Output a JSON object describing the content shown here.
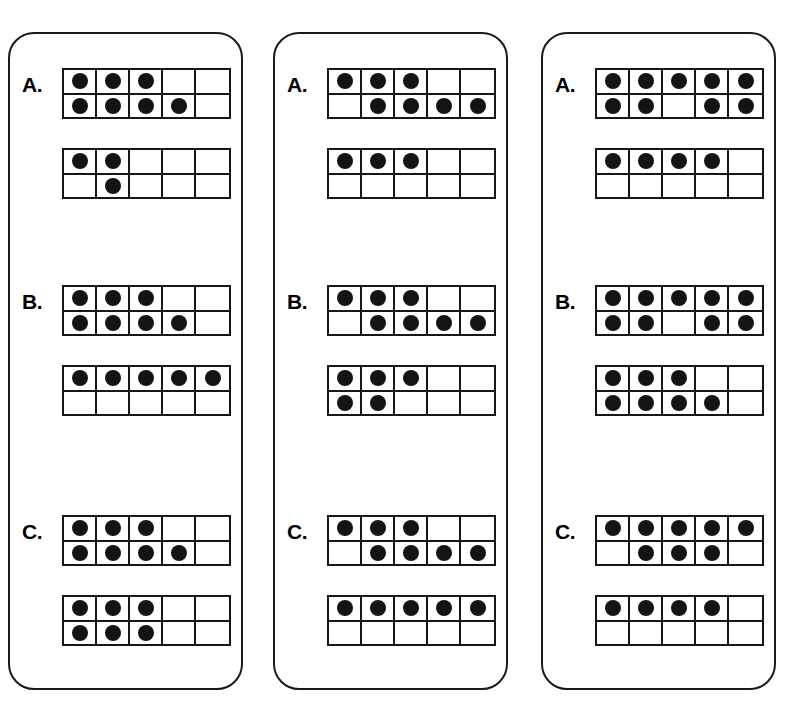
{
  "page": {
    "background_color": "#ffffff",
    "ink_color": "#141414",
    "card_border_color": "#1a1a1a",
    "grid_line_color": "#171717",
    "dot_color": "#141414"
  },
  "cards": [
    {
      "name": "card-1",
      "items": [
        {
          "label": "A.",
          "frames": [
            {
              "name": "ten-frame-top",
              "top_row": [
                true,
                true,
                true,
                false,
                false
              ],
              "bottom_row": [
                true,
                true,
                true,
                true,
                false
              ],
              "count": 7
            },
            {
              "name": "ten-frame-bottom",
              "top_row": [
                true,
                true,
                false,
                false,
                false
              ],
              "bottom_row": [
                false,
                true,
                false,
                false,
                false
              ],
              "count": 3
            }
          ]
        },
        {
          "label": "B.",
          "frames": [
            {
              "name": "ten-frame-top",
              "top_row": [
                true,
                true,
                true,
                false,
                false
              ],
              "bottom_row": [
                true,
                true,
                true,
                true,
                false
              ],
              "count": 7
            },
            {
              "name": "ten-frame-bottom",
              "top_row": [
                true,
                true,
                true,
                true,
                true
              ],
              "bottom_row": [
                false,
                false,
                false,
                false,
                false
              ],
              "count": 5
            }
          ]
        },
        {
          "label": "C.",
          "frames": [
            {
              "name": "ten-frame-top",
              "top_row": [
                true,
                true,
                true,
                false,
                false
              ],
              "bottom_row": [
                true,
                true,
                true,
                true,
                false
              ],
              "count": 7
            },
            {
              "name": "ten-frame-bottom",
              "top_row": [
                true,
                true,
                true,
                false,
                false
              ],
              "bottom_row": [
                true,
                true,
                true,
                false,
                false
              ],
              "count": 6
            }
          ]
        }
      ]
    },
    {
      "name": "card-2",
      "items": [
        {
          "label": "A.",
          "frames": [
            {
              "name": "ten-frame-top",
              "top_row": [
                true,
                true,
                true,
                false,
                false
              ],
              "bottom_row": [
                false,
                true,
                true,
                true,
                true
              ],
              "count": 7
            },
            {
              "name": "ten-frame-bottom",
              "top_row": [
                true,
                true,
                true,
                false,
                false
              ],
              "bottom_row": [
                false,
                false,
                false,
                false,
                false
              ],
              "count": 3
            }
          ]
        },
        {
          "label": "B.",
          "frames": [
            {
              "name": "ten-frame-top",
              "top_row": [
                true,
                true,
                true,
                false,
                false
              ],
              "bottom_row": [
                false,
                true,
                true,
                true,
                true
              ],
              "count": 7
            },
            {
              "name": "ten-frame-bottom",
              "top_row": [
                true,
                true,
                true,
                false,
                false
              ],
              "bottom_row": [
                true,
                true,
                false,
                false,
                false
              ],
              "count": 5
            }
          ]
        },
        {
          "label": "C.",
          "frames": [
            {
              "name": "ten-frame-top",
              "top_row": [
                true,
                true,
                true,
                false,
                false
              ],
              "bottom_row": [
                false,
                true,
                true,
                true,
                true
              ],
              "count": 7
            },
            {
              "name": "ten-frame-bottom",
              "top_row": [
                true,
                true,
                true,
                true,
                true
              ],
              "bottom_row": [
                false,
                false,
                false,
                false,
                false
              ],
              "count": 5
            }
          ]
        }
      ]
    },
    {
      "name": "card-3",
      "items": [
        {
          "label": "A.",
          "frames": [
            {
              "name": "ten-frame-top",
              "top_row": [
                true,
                true,
                true,
                true,
                true
              ],
              "bottom_row": [
                true,
                true,
                false,
                true,
                true
              ],
              "count": 9
            },
            {
              "name": "ten-frame-bottom",
              "top_row": [
                true,
                true,
                true,
                true,
                false
              ],
              "bottom_row": [
                false,
                false,
                false,
                false,
                false
              ],
              "count": 4
            }
          ]
        },
        {
          "label": "B.",
          "frames": [
            {
              "name": "ten-frame-top",
              "top_row": [
                true,
                true,
                true,
                true,
                true
              ],
              "bottom_row": [
                true,
                true,
                false,
                true,
                true
              ],
              "count": 9
            },
            {
              "name": "ten-frame-bottom",
              "top_row": [
                true,
                true,
                true,
                false,
                false
              ],
              "bottom_row": [
                true,
                true,
                true,
                true,
                false
              ],
              "count": 7
            }
          ]
        },
        {
          "label": "C.",
          "frames": [
            {
              "name": "ten-frame-top",
              "top_row": [
                true,
                true,
                true,
                true,
                true
              ],
              "bottom_row": [
                false,
                true,
                true,
                true,
                false
              ],
              "count": 8
            },
            {
              "name": "ten-frame-bottom",
              "top_row": [
                true,
                true,
                true,
                true,
                false
              ],
              "bottom_row": [
                false,
                false,
                false,
                false,
                false
              ],
              "count": 4
            }
          ]
        }
      ]
    }
  ]
}
